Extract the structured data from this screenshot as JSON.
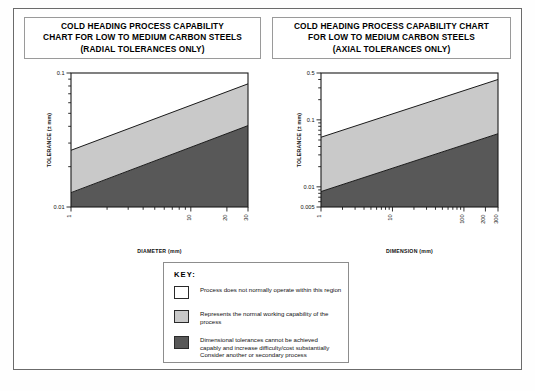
{
  "charts": [
    {
      "id": "radial",
      "title_lines": [
        "COLD HEADING PROCESS CAPABILITY",
        "CHART FOR LOW TO MEDIUM CARBON STEELS",
        "(RADIAL TOLERANCES ONLY)"
      ],
      "xlabel": "DIAMETER (mm)",
      "ylabel": "TOLERANCE (± mm)",
      "y_ticks": [
        "0.1",
        "0.01"
      ],
      "x_ticks": [
        "1",
        "10",
        "20",
        "30"
      ]
    },
    {
      "id": "axial",
      "title_lines": [
        "COLD HEADING PROCESS CAPABILITY CHART",
        "FOR LOW TO MEDIUM CARBON STEELS",
        "(AXIAL TOLERANCES ONLY)"
      ],
      "xlabel": "DIMENSION (mm)",
      "ylabel": "TOLERANCE (± mm)",
      "y_ticks": [
        "0.5",
        "0.1",
        "0.01",
        "0.005"
      ],
      "x_ticks": [
        "1",
        "10",
        "100",
        "200",
        "300"
      ]
    }
  ],
  "chart_data": [
    {
      "type": "area",
      "id": "radial",
      "title": "COLD HEADING PROCESS CAPABILITY CHART FOR LOW TO MEDIUM CARBON STEELS (RADIAL TOLERANCES ONLY)",
      "xlabel": "DIAMETER (mm)",
      "ylabel": "TOLERANCE (± mm)",
      "xscale": "log",
      "yscale": "log",
      "xlim": [
        1,
        30
      ],
      "ylim": [
        0.01,
        0.1
      ],
      "xticks": [
        1,
        10,
        20,
        30
      ],
      "yticks": [
        0.01,
        0.1
      ],
      "grid": false,
      "legend": "external-key",
      "series": [
        {
          "name": "upper boundary (top of normal working capability band)",
          "x": [
            1,
            30
          ],
          "y": [
            0.0265,
            0.083
          ]
        },
        {
          "name": "lower boundary (start of difficult/costly region)",
          "x": [
            1,
            30
          ],
          "y": [
            0.0128,
            0.0405
          ]
        }
      ],
      "regions": [
        {
          "name": "Process does not normally operate within this region",
          "color": "#ffffff",
          "position": "above upper boundary"
        },
        {
          "name": "Represents the normal working capability of the process",
          "color": "#c9c9c9",
          "position": "between boundaries"
        },
        {
          "name": "Dimensional tolerances cannot be achieved capably",
          "color": "#585858",
          "position": "below lower boundary"
        }
      ]
    },
    {
      "type": "area",
      "id": "axial",
      "title": "COLD HEADING PROCESS CAPABILITY CHART FOR LOW TO MEDIUM CARBON STEELS (AXIAL TOLERANCES ONLY)",
      "xlabel": "DIMENSION (mm)",
      "ylabel": "TOLERANCE (± mm)",
      "xscale": "log",
      "yscale": "log",
      "xlim": [
        1,
        300
      ],
      "ylim": [
        0.005,
        0.5
      ],
      "xticks": [
        1,
        10,
        100,
        200,
        300
      ],
      "yticks": [
        0.005,
        0.01,
        0.1,
        0.5
      ],
      "grid": false,
      "legend": "external-key",
      "series": [
        {
          "name": "upper boundary (top of normal working capability band)",
          "x": [
            1,
            300
          ],
          "y": [
            0.055,
            0.4
          ]
        },
        {
          "name": "lower boundary (start of difficult/costly region)",
          "x": [
            1,
            300
          ],
          "y": [
            0.0085,
            0.062
          ]
        }
      ],
      "regions": [
        {
          "name": "Process does not normally operate within this region",
          "color": "#ffffff",
          "position": "above upper boundary"
        },
        {
          "name": "Represents the normal working capability of the process",
          "color": "#c9c9c9",
          "position": "between boundaries"
        },
        {
          "name": "Dimensional tolerances cannot be achieved capably",
          "color": "#585858",
          "position": "below lower boundary"
        }
      ]
    }
  ],
  "key": {
    "title": "KEY:",
    "items": [
      {
        "color": "#ffffff",
        "lines": [
          "Process does not normally operate within this region"
        ]
      },
      {
        "color": "#c9c9c9",
        "lines": [
          "Represents the normal working capability of the",
          "process"
        ]
      },
      {
        "color": "#585858",
        "lines": [
          "Dimensional tolerances cannot be achieved",
          "capably and increase difficulty/cost substantially",
          "Consider another or secondary process"
        ]
      }
    ]
  },
  "colors": {
    "white_region": "#ffffff",
    "light_gray_region": "#c9c9c9",
    "dark_gray_region": "#585858",
    "frame": "#6b6b6b",
    "axis": "#1a1a1a"
  }
}
